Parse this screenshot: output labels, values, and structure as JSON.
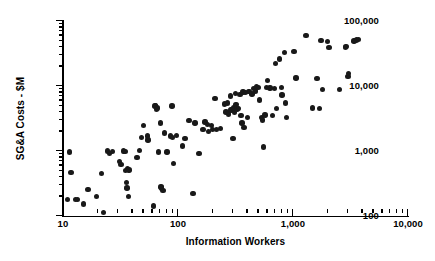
{
  "chart_data": {
    "type": "scatter",
    "title": "",
    "xlabel": "Information Workers",
    "ylabel": "SG&A Costs - $M",
    "xscale": "log",
    "yscale": "log",
    "xlim": [
      10,
      10000
    ],
    "ylim": [
      100,
      100000
    ],
    "grid": false,
    "legend": null,
    "xticks": [
      {
        "value": 10,
        "label": "10"
      },
      {
        "value": 100,
        "label": "100"
      },
      {
        "value": 1000,
        "label": "1,000"
      },
      {
        "value": 10000,
        "label": "10,000"
      }
    ],
    "yticks": [
      {
        "value": 100,
        "label": "100"
      },
      {
        "value": 1000,
        "label": "1,000"
      },
      {
        "value": 10000,
        "label": "10,000"
      },
      {
        "value": 100000,
        "label": "100,000"
      }
    ],
    "marker": {
      "shape": "circle",
      "color": "#191919",
      "size_px": 5.4
    },
    "points": [
      [
        11.0,
        180
      ],
      [
        11.4,
        960
      ],
      [
        11.7,
        470
      ],
      [
        12.8,
        178
      ],
      [
        13.3,
        178
      ],
      [
        15.0,
        152
      ],
      [
        16.5,
        255
      ],
      [
        19.5,
        200
      ],
      [
        21.5,
        450
      ],
      [
        22.5,
        113
      ],
      [
        24.5,
        1000
      ],
      [
        25.5,
        910
      ],
      [
        27.0,
        990
      ],
      [
        31.0,
        690
      ],
      [
        32.0,
        620
      ],
      [
        33.5,
        1000
      ],
      [
        34.5,
        990
      ],
      [
        35.0,
        500
      ],
      [
        35.5,
        330
      ],
      [
        36.0,
        270
      ],
      [
        36.5,
        530
      ],
      [
        37.0,
        200
      ],
      [
        37.5,
        510
      ],
      [
        44.0,
        800
      ],
      [
        46.0,
        1020
      ],
      [
        48.0,
        1600
      ],
      [
        50.0,
        2450
      ],
      [
        54.0,
        1700
      ],
      [
        55.0,
        1480
      ],
      [
        61.0,
        143
      ],
      [
        63.0,
        4900
      ],
      [
        64.0,
        5000
      ],
      [
        65.0,
        4350
      ],
      [
        66.0,
        4600
      ],
      [
        68.0,
        970
      ],
      [
        70.0,
        2700
      ],
      [
        71.0,
        280
      ],
      [
        72.0,
        270
      ],
      [
        74.0,
        245
      ],
      [
        76.0,
        1900
      ],
      [
        80.0,
        960
      ],
      [
        86.0,
        1700
      ],
      [
        89.0,
        4900
      ],
      [
        90.0,
        1600
      ],
      [
        91.0,
        640
      ],
      [
        97.0,
        1750
      ],
      [
        110.0,
        1200
      ],
      [
        115.0,
        1550
      ],
      [
        125.0,
        2950
      ],
      [
        135.0,
        220
      ],
      [
        140.0,
        2700
      ],
      [
        152.0,
        910
      ],
      [
        165.0,
        2150
      ],
      [
        172.0,
        2800
      ],
      [
        180.0,
        2550
      ],
      [
        185.0,
        2000
      ],
      [
        195.0,
        2450
      ],
      [
        200.0,
        2150
      ],
      [
        210.0,
        6400
      ],
      [
        215.0,
        2150
      ],
      [
        235.0,
        2200
      ],
      [
        255.0,
        5300
      ],
      [
        262.0,
        4000
      ],
      [
        268.0,
        5500
      ],
      [
        275.0,
        3700
      ],
      [
        285.0,
        7000
      ],
      [
        290.0,
        4300
      ],
      [
        300.0,
        1570
      ],
      [
        305.0,
        4600
      ],
      [
        310.0,
        3950
      ],
      [
        315.0,
        7700
      ],
      [
        320.0,
        5200
      ],
      [
        325.0,
        4400
      ],
      [
        335.0,
        4500
      ],
      [
        345.0,
        7400
      ],
      [
        352.0,
        3500
      ],
      [
        360.0,
        2700
      ],
      [
        368.0,
        8100
      ],
      [
        375.0,
        2300
      ],
      [
        385.0,
        7900
      ],
      [
        400.0,
        3300
      ],
      [
        410.0,
        8200
      ],
      [
        420.0,
        8300
      ],
      [
        440.0,
        7500
      ],
      [
        455.0,
        9100
      ],
      [
        470.0,
        8400
      ],
      [
        480.0,
        9700
      ],
      [
        500.0,
        9400
      ],
      [
        510.0,
        6100
      ],
      [
        530.0,
        3250
      ],
      [
        540.0,
        3000
      ],
      [
        555.0,
        1150
      ],
      [
        570.0,
        3600
      ],
      [
        585.0,
        9400
      ],
      [
        600.0,
        12200
      ],
      [
        630.0,
        9300
      ],
      [
        660.0,
        3500
      ],
      [
        690.0,
        9200
      ],
      [
        700.0,
        22000
      ],
      [
        720.0,
        4500
      ],
      [
        760.0,
        26000
      ],
      [
        790.0,
        9500
      ],
      [
        800.0,
        7300
      ],
      [
        840.0,
        33000
      ],
      [
        860.0,
        5500
      ],
      [
        880.0,
        3300
      ],
      [
        1020.0,
        34000
      ],
      [
        1060.0,
        13200
      ],
      [
        1300.0,
        60000
      ],
      [
        1480.0,
        4600
      ],
      [
        1620.0,
        13000
      ],
      [
        1700.0,
        4550
      ],
      [
        1750.0,
        50000
      ],
      [
        1800.0,
        8800
      ],
      [
        2000.0,
        48000
      ],
      [
        2050.0,
        39500
      ],
      [
        2550.0,
        8900
      ],
      [
        2850.0,
        39000
      ],
      [
        2900.0,
        40500
      ],
      [
        3000.0,
        14000
      ],
      [
        3050.0,
        15500
      ],
      [
        3400.0,
        49000
      ],
      [
        3550.0,
        51000
      ],
      [
        3700.0,
        52000
      ]
    ]
  }
}
